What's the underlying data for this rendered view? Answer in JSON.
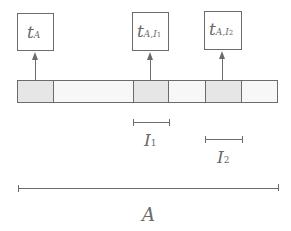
{
  "boxes": [
    {
      "id": "tA",
      "main": "t",
      "sub": "A",
      "subsub": ""
    },
    {
      "id": "tAI1",
      "main": "t",
      "sub": "A,I",
      "subsub": "1"
    },
    {
      "id": "tAI2",
      "main": "t",
      "sub": "A,I",
      "subsub": "2"
    }
  ],
  "bar": {
    "segments": [
      {
        "x0": 17,
        "x1": 53,
        "fill": "#e6e6e6"
      },
      {
        "x0": 53,
        "x1": 133,
        "fill": "#f7f7f7"
      },
      {
        "x0": 133,
        "x1": 168,
        "fill": "#e6e6e6"
      },
      {
        "x0": 168,
        "x1": 205,
        "fill": "#f7f7f7"
      },
      {
        "x0": 205,
        "x1": 241,
        "fill": "#e6e6e6"
      },
      {
        "x0": 241,
        "x1": 278,
        "fill": "#f7f7f7"
      }
    ]
  },
  "intervals": [
    {
      "id": "I1",
      "label": "I",
      "sub": "1"
    },
    {
      "id": "I2",
      "label": "I",
      "sub": "2"
    },
    {
      "id": "A",
      "label": "A",
      "sub": ""
    }
  ],
  "colors": {
    "stroke": "#6b6b6b",
    "shaded": "#e6e6e6",
    "light": "#f7f7f7"
  }
}
